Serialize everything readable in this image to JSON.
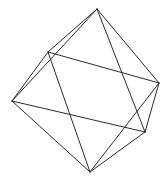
{
  "figure": {
    "kind": "3d-polyhedron-line-drawing",
    "shape_name": "octahedron",
    "canvas": {
      "width": 167,
      "height": 179,
      "background": "#ffffff"
    },
    "style": {
      "stroke_color": "#2b2b2b",
      "hidden_stroke_color": "#3a3a3a",
      "stroke_width": 1,
      "fill": "none"
    },
    "vertices": [
      {
        "id": "top",
        "label": "top apex",
        "x": 97,
        "y": 9
      },
      {
        "id": "back",
        "label": "back equatorial",
        "x": 48,
        "y": 52
      },
      {
        "id": "right",
        "label": "right equatorial",
        "x": 159,
        "y": 83
      },
      {
        "id": "left",
        "label": "left equatorial",
        "x": 12,
        "y": 101
      },
      {
        "id": "front",
        "label": "front equatorial",
        "x": 145,
        "y": 132
      },
      {
        "id": "bottom",
        "label": "bottom apex",
        "x": 90,
        "y": 172
      }
    ],
    "edges": [
      {
        "from": "top",
        "to": "back",
        "visibility": "visible"
      },
      {
        "from": "top",
        "to": "right",
        "visibility": "visible"
      },
      {
        "from": "top",
        "to": "left",
        "visibility": "visible"
      },
      {
        "from": "top",
        "to": "front",
        "visibility": "visible"
      },
      {
        "from": "bottom",
        "to": "back",
        "visibility": "visible"
      },
      {
        "from": "bottom",
        "to": "right",
        "visibility": "visible"
      },
      {
        "from": "bottom",
        "to": "left",
        "visibility": "visible"
      },
      {
        "from": "bottom",
        "to": "front",
        "visibility": "visible"
      },
      {
        "from": "back",
        "to": "right",
        "visibility": "visible"
      },
      {
        "from": "right",
        "to": "front",
        "visibility": "visible"
      },
      {
        "from": "front",
        "to": "left",
        "visibility": "visible"
      },
      {
        "from": "left",
        "to": "back",
        "visibility": "visible"
      }
    ],
    "edge_count": 12,
    "vertex_count": 6,
    "face_count": 8
  }
}
